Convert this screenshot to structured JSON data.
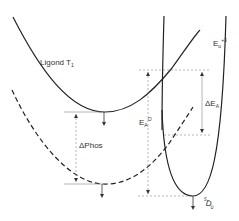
{
  "diagram": {
    "type": "potential-energy-curves",
    "colors": {
      "line": "#222222",
      "guide": "#888888",
      "background": "#ffffff"
    },
    "curves": [
      {
        "id": "ligand-t1",
        "label": "Ligond",
        "label_sub": "1",
        "label_main": "T",
        "style": "solid"
      },
      {
        "id": "ligand-t1-relaxed",
        "style": "dashed"
      },
      {
        "id": "eu3-excited",
        "label_main": "E",
        "label_sub": "u",
        "label_sup": "+3",
        "style": "solid"
      },
      {
        "id": "eu-5d0",
        "label_sup": "5",
        "label_main": "D",
        "label_sub": "0",
        "style": "solid"
      }
    ],
    "labels": {
      "ligand_t1": "Ligond  T",
      "ligand_t1_sub": "1",
      "eu3_main": "E",
      "eu3_sub": "u",
      "eu3_sup": "+3",
      "delta_phos": "ΔPhos",
      "delta_ea_main": "ΔE",
      "delta_ea_sub": "A",
      "ea0_main": "E",
      "ea0_sub": "A",
      "ea0_sup": "O",
      "d0_sup": "5",
      "d0_main": "D",
      "d0_sub": "0"
    }
  }
}
